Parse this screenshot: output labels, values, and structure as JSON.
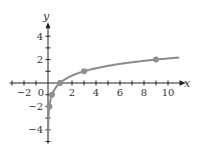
{
  "chart_data": {
    "type": "line",
    "title": "",
    "function": "y = log_3(x)",
    "xlabel": "x",
    "ylabel": "y",
    "xlim": [
      -3,
      11
    ],
    "ylim": [
      -5,
      5
    ],
    "x_ticks": [
      -2,
      0,
      2,
      4,
      6,
      8,
      10
    ],
    "y_ticks": [
      4,
      2,
      -2,
      -4
    ],
    "x_tick_labels": [
      "−2",
      "0",
      "2",
      "4",
      "6",
      "8",
      "10"
    ],
    "y_tick_labels": [
      "4",
      "2",
      "−2",
      "−4"
    ],
    "grid": false,
    "legend": null,
    "series": [
      {
        "name": "curve",
        "points": [
          [
            0.1111,
            -2
          ],
          [
            0.3333,
            -1
          ],
          [
            1,
            0
          ],
          [
            3,
            1
          ],
          [
            9,
            2
          ]
        ]
      }
    ],
    "marked_points": [
      [
        0.1111,
        -2
      ],
      [
        0.3333,
        -1
      ],
      [
        1,
        0
      ],
      [
        3,
        1
      ],
      [
        9,
        2
      ]
    ],
    "colors": {
      "curve": "#8a8a8a",
      "points": "#8f8f8f",
      "axes": "#222222"
    }
  }
}
